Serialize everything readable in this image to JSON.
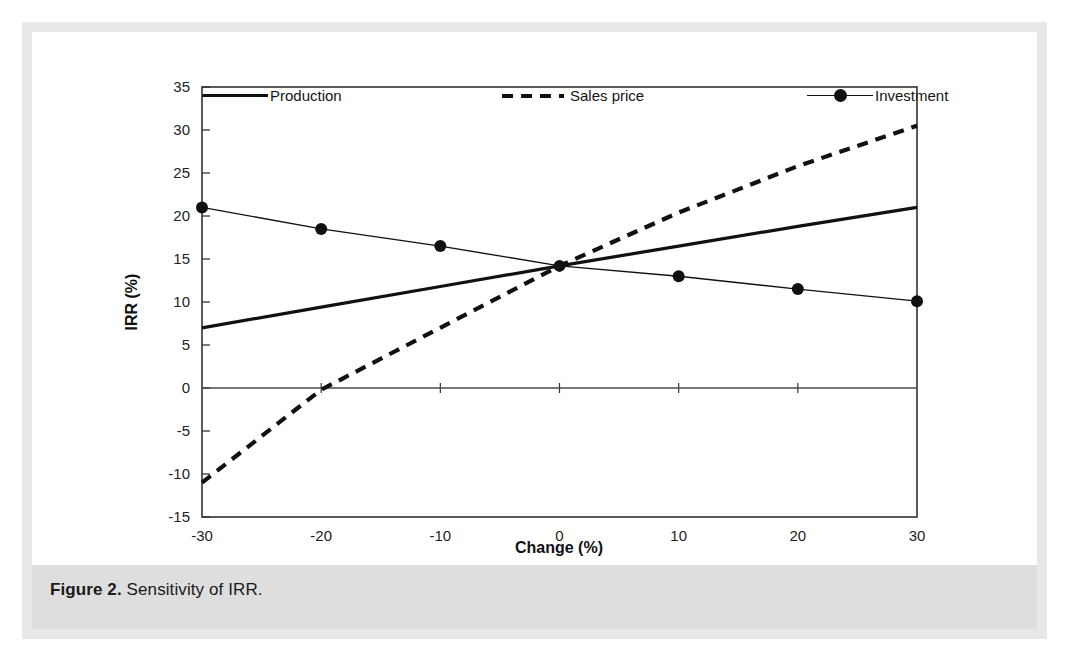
{
  "figure": {
    "label": "Figure 2.",
    "caption": "Sensitivity of IRR."
  },
  "legend": [
    {
      "name": "production",
      "label": "Production",
      "style": "solid-thick",
      "color": "#111111"
    },
    {
      "name": "sales-price",
      "label": "Sales price",
      "style": "dashed",
      "color": "#111111"
    },
    {
      "name": "investment",
      "label": "Investment",
      "style": "line-marker",
      "color": "#111111"
    }
  ],
  "chart_data": {
    "type": "line",
    "title": "",
    "xlabel": "Change (%)",
    "ylabel": "IRR (%)",
    "xlim": [
      -30,
      30
    ],
    "ylim": [
      -15,
      35
    ],
    "xticks": [
      -30,
      -20,
      -10,
      0,
      10,
      20,
      30
    ],
    "yticks": [
      -15,
      -10,
      -5,
      0,
      5,
      10,
      15,
      20,
      25,
      30,
      35
    ],
    "xtick_labels": [
      "-30",
      "-20",
      "-10",
      "0",
      "10",
      "20",
      "30"
    ],
    "ytick_labels": [
      "-15",
      "-10",
      "-5",
      "0",
      "5",
      "10",
      "15",
      "20",
      "25",
      "30",
      "35"
    ],
    "grid": false,
    "legend_position": "top",
    "x": [
      -30,
      -20,
      -10,
      0,
      10,
      20,
      30
    ],
    "series": [
      {
        "name": "Production",
        "style": "solid-thick",
        "markers": false,
        "values": [
          7.0,
          9.4,
          11.8,
          14.2,
          16.5,
          18.8,
          21.0
        ]
      },
      {
        "name": "Sales price",
        "style": "dashed",
        "markers": false,
        "values": [
          -11.0,
          -0.2,
          7.0,
          14.2,
          20.4,
          25.8,
          30.5
        ]
      },
      {
        "name": "Investment",
        "style": "thin-with-dots",
        "markers": true,
        "values": [
          21.0,
          18.5,
          16.5,
          14.2,
          13.0,
          11.5,
          10.1
        ]
      }
    ]
  }
}
